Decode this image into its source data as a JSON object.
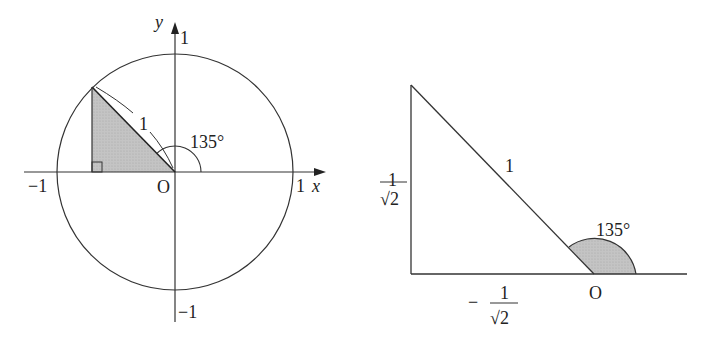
{
  "left_diagram": {
    "title": "Unit circle with 135 degree angle",
    "axis_labels": {
      "x": "x",
      "y": "y"
    },
    "tick_labels": {
      "x_pos": "1",
      "x_neg": "−1",
      "y_pos": "1",
      "y_neg": "−1"
    },
    "origin_label": "O",
    "radius_label": "1",
    "angle_label": "135°",
    "colors": {
      "stroke": "#333333",
      "shade": "#c8c8c8"
    }
  },
  "right_diagram": {
    "title": "Reference right triangle",
    "hypotenuse_label": "1",
    "vertical_label": {
      "numerator": "1",
      "denominator": "√2"
    },
    "horizontal_label": {
      "sign": "−",
      "numerator": "1",
      "denominator": "√2"
    },
    "origin_label": "O",
    "angle_label": "135°",
    "colors": {
      "stroke": "#333333",
      "shade": "#c8c8c8"
    }
  }
}
